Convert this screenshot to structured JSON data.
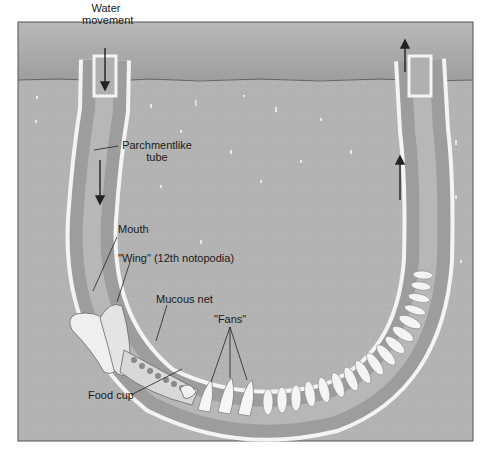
{
  "diagram": {
    "colors": {
      "water": "#a8a8a8",
      "sand": "#b4b4b4",
      "tube_wall": "#f2f2f2",
      "tube_interior": "#a0a0a0",
      "worm_body": "#eeeeee",
      "frame": "#555555"
    },
    "labels": {
      "water_movement_1": "Water",
      "water_movement_2": "movement",
      "tube_1": "Parchmentlike",
      "tube_2": "tube",
      "mouth": "Mouth",
      "wing": "\"Wing\" (12th notopodia)",
      "mucous_net": "Mucous net",
      "fans": "\"Fans\"",
      "food_cup": "Food cup"
    },
    "arrows": [
      {
        "name": "inflow-arrow-top",
        "direction": "down"
      },
      {
        "name": "inflow-arrow-mid",
        "direction": "down"
      },
      {
        "name": "outflow-arrow-mid",
        "direction": "up"
      },
      {
        "name": "outflow-arrow-top",
        "direction": "up"
      }
    ]
  }
}
